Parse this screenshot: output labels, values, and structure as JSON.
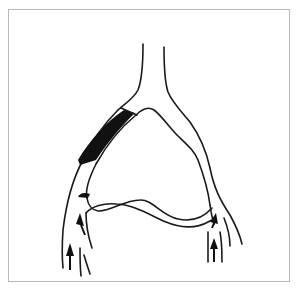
{
  "figure": {
    "type": "line-art vascular diagram",
    "colors": {
      "stroke": "#1a1a1a",
      "shaded_segment": "#111111",
      "frame_border": "#b8b8b8",
      "background": "#ffffff"
    },
    "elements": {
      "trunk": "Upper vertical vessel",
      "left_branch": "Left arm of loop with shaded (occluded) segment",
      "right_branch": "Right arm of loop",
      "lower_connection": "Wavy lower connecting vessel",
      "flow_arrows_left": 3,
      "flow_arrows_right": 2
    }
  }
}
